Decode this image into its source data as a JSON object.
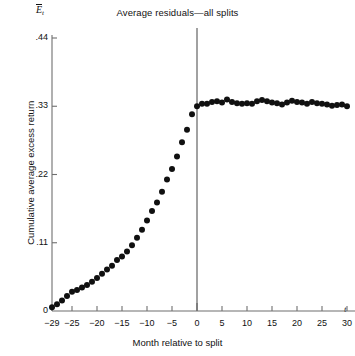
{
  "chart_data": {
    "type": "scatter",
    "title": "Average residuals—all splits",
    "xlabel": "Month relative to split",
    "ylabel": "Cumulative average excess return",
    "y_axis_symbol_base": "E",
    "y_axis_symbol_sub": "t",
    "x_axis_symbol": "t",
    "grid": false,
    "legend": "none",
    "xlim": [
      -29,
      31
    ],
    "ylim": [
      0,
      0.44
    ],
    "xticks": [
      -29,
      -25,
      -20,
      -15,
      -10,
      -5,
      0,
      5,
      10,
      15,
      20,
      25,
      30
    ],
    "xtick_labels": [
      "−29",
      "−25",
      "−20",
      "−15",
      "−10",
      "−5",
      "0",
      "5",
      "10",
      "15",
      "20",
      "25",
      "30"
    ],
    "yticks": [
      0,
      0.11,
      0.22,
      0.33,
      0.44
    ],
    "ytick_labels": [
      "0",
      ".11",
      ".22",
      ".33",
      ".44"
    ],
    "annotations": [
      {
        "name": "split-event-line",
        "type": "vline",
        "x": 0,
        "label": "split month"
      }
    ],
    "marker": {
      "shape": "circle",
      "color": "#101010",
      "size_px": 4.2
    },
    "series": [
      {
        "name": "Cumulative average residual",
        "x": [
          -29,
          -28,
          -27,
          -26,
          -25,
          -24,
          -23,
          -22,
          -21,
          -20,
          -19,
          -18,
          -17,
          -16,
          -15,
          -14,
          -13,
          -12,
          -11,
          -10,
          -9,
          -8,
          -7,
          -6,
          -5,
          -4,
          -3,
          -2,
          -1,
          0,
          1,
          2,
          3,
          4,
          5,
          6,
          7,
          8,
          9,
          10,
          11,
          12,
          13,
          14,
          15,
          16,
          17,
          18,
          19,
          20,
          21,
          22,
          23,
          24,
          25,
          26,
          27,
          28,
          29,
          30
        ],
        "y": [
          0.006,
          0.011,
          0.017,
          0.024,
          0.031,
          0.034,
          0.038,
          0.042,
          0.047,
          0.053,
          0.06,
          0.067,
          0.073,
          0.082,
          0.088,
          0.096,
          0.106,
          0.118,
          0.131,
          0.146,
          0.161,
          0.175,
          0.192,
          0.212,
          0.229,
          0.249,
          0.272,
          0.292,
          0.317,
          0.33,
          0.334,
          0.334,
          0.337,
          0.338,
          0.336,
          0.341,
          0.337,
          0.335,
          0.334,
          0.335,
          0.334,
          0.338,
          0.34,
          0.338,
          0.336,
          0.335,
          0.333,
          0.336,
          0.339,
          0.337,
          0.336,
          0.334,
          0.337,
          0.335,
          0.334,
          0.333,
          0.331,
          0.332,
          0.333,
          0.33
        ]
      }
    ]
  },
  "colors": {
    "axis": "#6f6f6f",
    "marker": "#101010",
    "split_line": "#6f6f6f",
    "text": "#111111",
    "background": "#ffffff"
  }
}
